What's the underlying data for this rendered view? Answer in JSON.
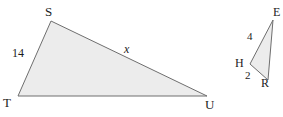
{
  "figure": {
    "background_color": "#ffffff",
    "fill_color": "#ececec",
    "stroke_color": "#6e6e6e",
    "label_color": "#1c1c1c",
    "triangles": [
      {
        "name": "triangle-stu",
        "vertices": [
          {
            "label": "S",
            "x": 51,
            "y": 21
          },
          {
            "label": "T",
            "x": 18,
            "y": 96
          },
          {
            "label": "U",
            "x": 207,
            "y": 96
          }
        ],
        "vertex_labels": [
          {
            "name": "vertex-label-s",
            "text": "S",
            "left": 45,
            "top": 5
          },
          {
            "name": "vertex-label-t",
            "text": "T",
            "left": 3,
            "top": 96
          },
          {
            "name": "vertex-label-u",
            "text": "U",
            "left": 205,
            "top": 98
          }
        ],
        "side_labels": [
          {
            "name": "side-label-ts",
            "text": "14",
            "left": 12,
            "top": 47,
            "italic": false
          },
          {
            "name": "side-label-su",
            "text": "x",
            "left": 124,
            "top": 43,
            "italic": true
          }
        ]
      },
      {
        "name": "triangle-ehr",
        "vertices": [
          {
            "label": "E",
            "x": 273,
            "y": 20
          },
          {
            "label": "H",
            "x": 250,
            "y": 64
          },
          {
            "label": "R",
            "x": 268,
            "y": 80
          }
        ],
        "vertex_labels": [
          {
            "name": "vertex-label-e",
            "text": "E",
            "left": 273,
            "top": 6
          },
          {
            "name": "vertex-label-h",
            "text": "H",
            "left": 235,
            "top": 57
          },
          {
            "name": "vertex-label-r",
            "text": "R",
            "left": 261,
            "top": 77
          }
        ],
        "side_labels": [
          {
            "name": "side-label-he",
            "text": "4",
            "left": 247,
            "top": 31,
            "italic": false
          },
          {
            "name": "side-label-hr",
            "text": "2",
            "left": 245,
            "top": 70,
            "italic": false
          }
        ]
      }
    ]
  }
}
